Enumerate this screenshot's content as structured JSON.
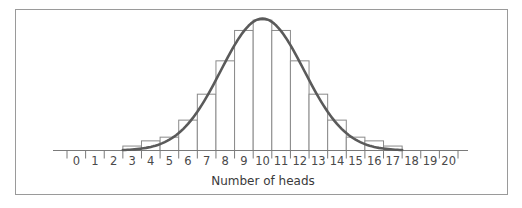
{
  "chart_data": {
    "type": "bar",
    "title": "",
    "subtitle": "",
    "xlabel": "Number of heads",
    "ylabel": "",
    "categories": [
      "0",
      "1",
      "2",
      "3",
      "4",
      "5",
      "6",
      "7",
      "8",
      "9",
      "10",
      "11",
      "12",
      "13",
      "14",
      "15",
      "16",
      "17",
      "18",
      "19",
      "20"
    ],
    "series": [
      {
        "name": "Binomial probability (histogram)",
        "type": "bar",
        "values": [
          0,
          0,
          0,
          0.006,
          0.013,
          0.018,
          0.041,
          0.076,
          0.121,
          0.162,
          0.176,
          0.162,
          0.121,
          0.076,
          0.041,
          0.018,
          0.013,
          0.006,
          0,
          0,
          0
        ]
      },
      {
        "name": "Normal approximation curve",
        "type": "line",
        "mean": 10,
        "sd": 2.236,
        "x_range": [
          2.5,
          17.5
        ]
      }
    ],
    "xlim": [
      -0.5,
      20.5
    ],
    "ylim": [
      0,
      0.18
    ],
    "grid": false,
    "legend": "none",
    "y_axis_visible": false
  },
  "axis": {
    "title": "Number of heads",
    "tick_labels": [
      "0",
      "1",
      "2",
      "3",
      "4",
      "5",
      "6",
      "7",
      "8",
      "9",
      "10",
      "11",
      "12",
      "13",
      "14",
      "15",
      "16",
      "17",
      "18",
      "19",
      "20"
    ]
  },
  "colors": {
    "curve": "#5a5a5a",
    "bar_stroke": "#8a8a8a",
    "frame": "#9a9a9a",
    "text": "#4a4a4a"
  }
}
